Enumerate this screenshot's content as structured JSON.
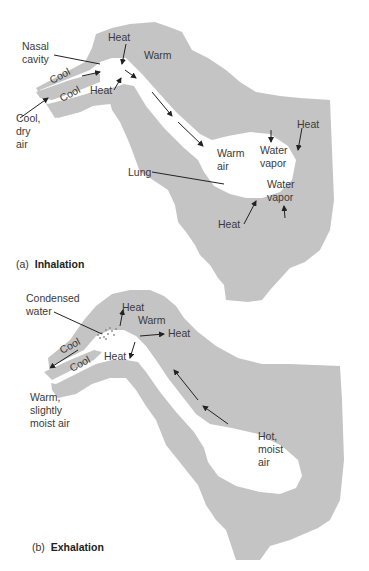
{
  "colors": {
    "tissue": "#c4c4c4",
    "airway": "#ffffff",
    "text": "#3a3a3a",
    "arrow": "#222222"
  },
  "panel_a": {
    "caption_prefix": "(a)",
    "caption_title": "Inhalation",
    "labels": {
      "nasal_cavity_1": "Nasal",
      "nasal_cavity_2": "cavity",
      "heat_top": "Heat",
      "warm": "Warm",
      "cool_upper": "Cool",
      "cool_lower": "Cool",
      "heat_lower": "Heat",
      "cool_dry_1": "Cool,",
      "cool_dry_2": "dry",
      "cool_dry_3": "air",
      "warm_air_1": "Warm",
      "warm_air_2": "air",
      "water_vapor_top_1": "Water",
      "water_vapor_top_2": "vapor",
      "heat_right": "Heat",
      "lung": "Lung",
      "water_vapor_bottom_1": "Water",
      "water_vapor_bottom_2": "vapor",
      "heat_bottom": "Heat"
    }
  },
  "panel_b": {
    "caption_prefix": "(b)",
    "caption_title": "Exhalation",
    "labels": {
      "condensed_water_1": "Condensed",
      "condensed_water_2": "water",
      "heat_top": "Heat",
      "warm": "Warm",
      "heat_right": "Heat",
      "cool_upper": "Cool",
      "cool_lower": "Cool",
      "heat_lower": "Heat",
      "warm_moist_1": "Warm,",
      "warm_moist_2": "slightly",
      "warm_moist_3": "moist air",
      "hot_moist_1": "Hot,",
      "hot_moist_2": "moist",
      "hot_moist_3": "air"
    }
  }
}
